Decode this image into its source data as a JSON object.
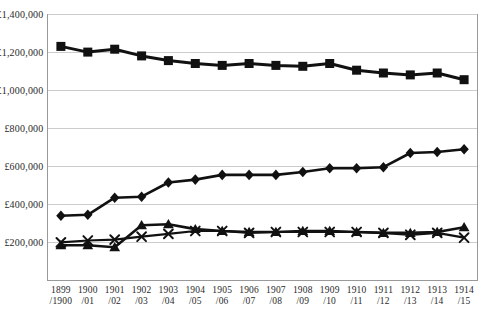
{
  "chart_data": {
    "type": "line",
    "title": "",
    "xlabel": "",
    "ylabel": "",
    "ylim": [
      0,
      1400000
    ],
    "grid": "horizontal",
    "legend": "none",
    "currency_symbol": "£",
    "categories": [
      "1899/1900",
      "1900/01",
      "1901/02",
      "1902/03",
      "1903/04",
      "1904/05",
      "1905/06",
      "1906/07",
      "1907/08",
      "1908/09",
      "1909/10",
      "1910/11",
      "1911/12",
      "1912/13",
      "1913/14",
      "1914/15"
    ],
    "x_tick_lines": [
      [
        "1899",
        "/1900"
      ],
      [
        "1900",
        "/01"
      ],
      [
        "1901",
        "/02"
      ],
      [
        "1902",
        "/03"
      ],
      [
        "1903",
        "/04"
      ],
      [
        "1904",
        "/05"
      ],
      [
        "1905",
        "/06"
      ],
      [
        "1906",
        "/07"
      ],
      [
        "1907",
        "/08"
      ],
      [
        "1908",
        "/09"
      ],
      [
        "1909",
        "/10"
      ],
      [
        "1910",
        "/11"
      ],
      [
        "1911",
        "/12"
      ],
      [
        "1912",
        "/13"
      ],
      [
        "1913",
        "/14"
      ],
      [
        "1914",
        "/15"
      ]
    ],
    "y_ticks": [
      {
        "value": 200000,
        "label": "£200,000"
      },
      {
        "value": 400000,
        "label": "£400,000"
      },
      {
        "value": 600000,
        "label": "£600,000"
      },
      {
        "value": 800000,
        "label": "£800,000"
      },
      {
        "value": 1000000,
        "label": "£1,000,000"
      },
      {
        "value": 1200000,
        "label": "£1,200,000"
      },
      {
        "value": 1400000,
        "label": "£1,400,000"
      }
    ],
    "series": [
      {
        "name": "squares-series",
        "marker": "square",
        "color": "#111111",
        "values": [
          1230000,
          1200000,
          1215000,
          1180000,
          1155000,
          1140000,
          1130000,
          1140000,
          1130000,
          1125000,
          1140000,
          1105000,
          1090000,
          1080000,
          1090000,
          1055000
        ]
      },
      {
        "name": "diamonds-series",
        "marker": "diamond",
        "color": "#111111",
        "values": [
          340000,
          345000,
          435000,
          440000,
          515000,
          530000,
          555000,
          555000,
          555000,
          570000,
          590000,
          590000,
          595000,
          670000,
          675000,
          690000
        ]
      },
      {
        "name": "triangles-series",
        "marker": "triangle",
        "color": "#111111",
        "values": [
          185000,
          185000,
          175000,
          290000,
          295000,
          270000,
          260000,
          255000,
          255000,
          260000,
          260000,
          255000,
          250000,
          250000,
          255000,
          280000
        ]
      },
      {
        "name": "x-marks-series",
        "marker": "x",
        "color": "#111111",
        "values": [
          200000,
          210000,
          215000,
          230000,
          245000,
          260000,
          260000,
          250000,
          255000,
          255000,
          255000,
          255000,
          250000,
          240000,
          250000,
          225000
        ]
      }
    ]
  },
  "colors": {
    "series_line": "#111111",
    "gridline": "#cccccc",
    "frame": "#999999",
    "tick_text": "#2a2a2a",
    "background": "#ffffff"
  }
}
